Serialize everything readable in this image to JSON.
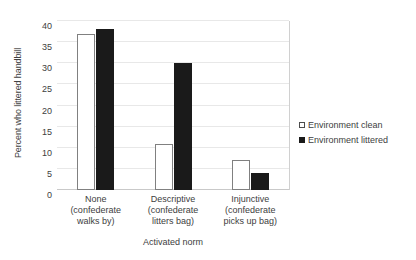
{
  "chart_data": {
    "type": "bar",
    "title": "",
    "subtitle": "",
    "xlabel": "Activated norm",
    "ylabel": "Percent who littered handbill",
    "categories": [
      "None\n(confederate\nwalks by)",
      "Descriptive\n(confederate\nlitters bag)",
      "Injunctive\n(confederate\npicks up bag)"
    ],
    "category_lines": [
      [
        "None",
        "(confederate",
        "walks by)"
      ],
      [
        "Descriptive",
        "(confederate",
        "litters bag)"
      ],
      [
        "Injunctive",
        "(confederate",
        "picks up bag)"
      ]
    ],
    "series": [
      {
        "name": "Environment clean",
        "values": [
          37,
          11,
          7
        ],
        "fill": "#ffffff",
        "stroke": "#808080"
      },
      {
        "name": "Environment littered",
        "values": [
          38,
          30,
          4
        ],
        "fill": "#1a1a1a",
        "stroke": "#1a1a1a"
      }
    ],
    "ylim": [
      0,
      40
    ],
    "ytick_step": 5,
    "yticks": [
      0,
      5,
      10,
      15,
      20,
      25,
      30,
      35,
      40
    ],
    "ytick_labels": [
      "0",
      "5",
      "10",
      "15",
      "20",
      "25",
      "30",
      "35",
      "40"
    ],
    "grid": true,
    "grid_axis": "y",
    "grid_color": "#e8e8e8",
    "legend_position": "right",
    "legend": [
      "Environment clean",
      "Environment littered"
    ],
    "background": "#ffffff",
    "text_color": "#404040"
  }
}
